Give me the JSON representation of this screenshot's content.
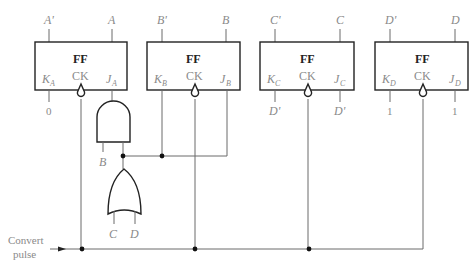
{
  "diagram": {
    "colors": {
      "wire": "#6a6a6a",
      "outline": "#222222",
      "label": "#8a8a8a"
    },
    "flipflops": [
      {
        "id": "A",
        "label": "FF",
        "ck": "CK",
        "out_left": "A'",
        "out_right": "A",
        "k_main": "K",
        "k_sub": "A",
        "j_main": "J",
        "j_sub": "A",
        "k_input": "0",
        "j_input": ""
      },
      {
        "id": "B",
        "label": "FF",
        "ck": "CK",
        "out_left": "B'",
        "out_right": "B",
        "k_main": "K",
        "k_sub": "B",
        "j_main": "J",
        "j_sub": "B",
        "k_input": "",
        "j_input": ""
      },
      {
        "id": "C",
        "label": "FF",
        "ck": "CK",
        "out_left": "C'",
        "out_right": "C",
        "k_main": "K",
        "k_sub": "C",
        "j_main": "J",
        "j_sub": "C",
        "k_input": "D'",
        "j_input": "D'"
      },
      {
        "id": "D",
        "label": "FF",
        "ck": "CK",
        "out_left": "D'",
        "out_right": "D",
        "k_main": "K",
        "k_sub": "D",
        "j_main": "J",
        "j_sub": "D",
        "k_input": "1",
        "j_input": "1"
      }
    ],
    "gates": {
      "and_gate": {
        "type": "AND",
        "input_label": "B"
      },
      "or_gate": {
        "type": "OR",
        "inputs": [
          "C",
          "D"
        ]
      }
    },
    "clock": {
      "line1": "Convert",
      "line2": "pulse"
    }
  }
}
